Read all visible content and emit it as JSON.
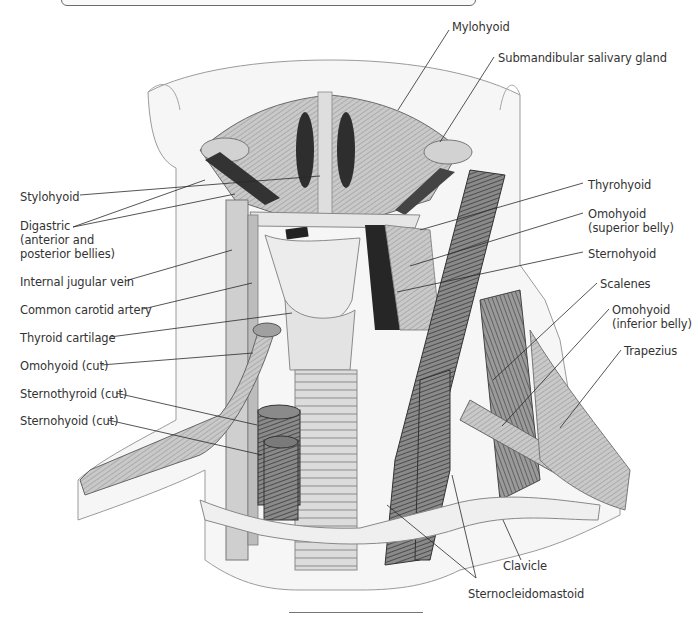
{
  "figure": {
    "labels_left": [
      {
        "id": "stylohyoid",
        "text": "Stylohyoid",
        "x": 20,
        "y": 190
      },
      {
        "id": "digastric",
        "text": "Digastric\n(anterior and\nposterior bellies)",
        "x": 20,
        "y": 219
      },
      {
        "id": "internal-jugular-vein",
        "text": "Internal jugular vein",
        "x": 20,
        "y": 275
      },
      {
        "id": "common-carotid-artery",
        "text": "Common carotid artery",
        "x": 20,
        "y": 303
      },
      {
        "id": "thyroid-cartilage",
        "text": "Thyroid cartilage",
        "x": 20,
        "y": 331
      },
      {
        "id": "omohyoid-cut",
        "text": "Omohyoid (cut)",
        "x": 20,
        "y": 359
      },
      {
        "id": "sternothyroid-cut",
        "text": "Sternothyroid (cut)",
        "x": 20,
        "y": 387
      },
      {
        "id": "sternohyoid-cut",
        "text": "Sternohyoid (cut)",
        "x": 20,
        "y": 414
      }
    ],
    "labels_right": [
      {
        "id": "mylohyoid",
        "text": "Mylohyoid",
        "x": 452,
        "y": 26
      },
      {
        "id": "submandibular-salivary-gland",
        "text": "Submandibular salivary gland",
        "x": 498,
        "y": 52
      },
      {
        "id": "thyrohyoid",
        "text": "Thyrohyoid",
        "x": 588,
        "y": 179
      },
      {
        "id": "omohyoid-superior",
        "text": "Omohyoid\n(superior belly)",
        "x": 588,
        "y": 207
      },
      {
        "id": "sternohyoid",
        "text": "Sternohyoid",
        "x": 588,
        "y": 248
      },
      {
        "id": "scalenes",
        "text": "Scalenes",
        "x": 600,
        "y": 277
      },
      {
        "id": "omohyoid-inferior",
        "text": "Omohyoid\n(inferior belly)",
        "x": 612,
        "y": 303
      },
      {
        "id": "trapezius",
        "text": "Trapezius",
        "x": 624,
        "y": 344
      },
      {
        "id": "clavicle",
        "text": "Clavicle",
        "x": 503,
        "y": 560
      },
      {
        "id": "sternocleidomastoid",
        "text": "Sternocleidomastoid",
        "x": 468,
        "y": 588
      }
    ]
  },
  "colors": {
    "leader_line": "#2a2a2a",
    "label_text": "#333333",
    "muscle_dark": "#3a3a3a",
    "muscle_mid": "#7a7a7a",
    "muscle_light": "#bdbdbd",
    "skin": "#e9e9e9"
  }
}
